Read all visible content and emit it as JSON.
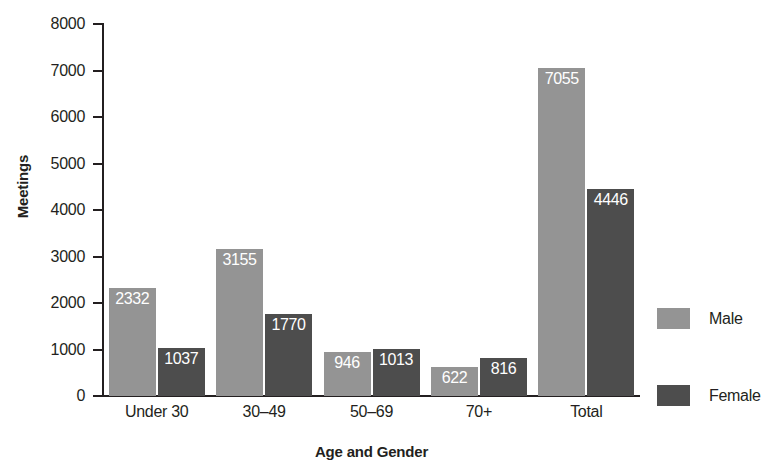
{
  "chart_data": {
    "type": "bar",
    "title": "",
    "xlabel": "Age and Gender",
    "ylabel": "Meetings",
    "categories": [
      "Under 30",
      "30–49",
      "50–69",
      "70+",
      "Total"
    ],
    "series": [
      {
        "name": "Male",
        "color": "#949494",
        "values": [
          2332,
          3155,
          946,
          622,
          7055
        ]
      },
      {
        "name": "Female",
        "color": "#4d4d4d",
        "values": [
          1037,
          1770,
          1013,
          816,
          4446
        ]
      }
    ],
    "ylim": [
      0,
      8000
    ],
    "yticks": [
      0,
      1000,
      2000,
      3000,
      4000,
      5000,
      6000,
      7000,
      8000
    ],
    "ytick_labels": [
      "0",
      "1000",
      "2000",
      "3000",
      "4000",
      "5000",
      "6000",
      "7000",
      "8000"
    ],
    "grid": false,
    "legend_position": "right",
    "data_labels": true,
    "data_label_color": "#ffffff",
    "axis_color": "#231f20"
  },
  "legend": {
    "items": [
      {
        "label": "Male",
        "color": "#949494"
      },
      {
        "label": "Female",
        "color": "#4d4d4d"
      }
    ]
  }
}
